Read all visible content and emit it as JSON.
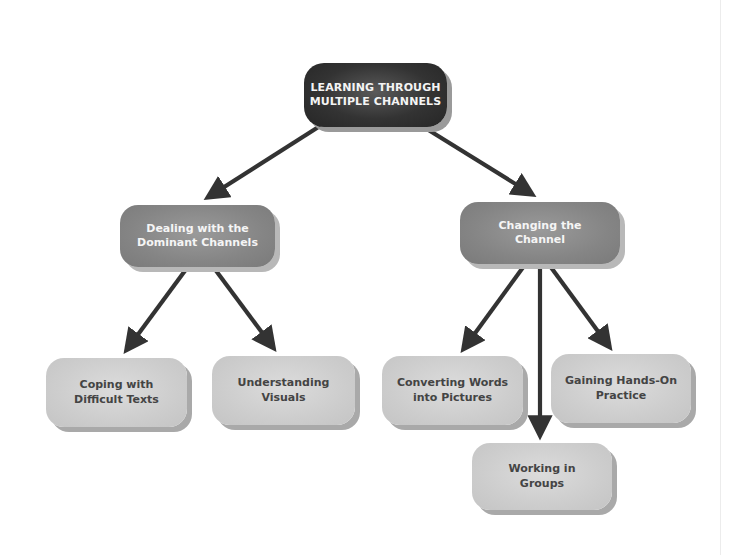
{
  "diagram": {
    "type": "concept-map",
    "root": {
      "line1": "LEARNING THROUGH",
      "line2": "MULTIPLE CHANNELS"
    },
    "branches": [
      {
        "line1": "Dealing with the",
        "line2": "Dominant Channels",
        "children": [
          {
            "line1": "Coping with",
            "line2": "Difficult Texts"
          },
          {
            "line1": "Understanding",
            "line2": "Visuals"
          }
        ]
      },
      {
        "line1": "Changing the",
        "line2": "Channel",
        "children": [
          {
            "line1": "Converting Words",
            "line2": "into Pictures"
          },
          {
            "line1": "Working in",
            "line2": "Groups"
          },
          {
            "line1": "Gaining Hands-On",
            "line2": "Practice"
          }
        ]
      }
    ],
    "colors": {
      "root_fill": "#333333",
      "root_text": "#f4f4f4",
      "mid_fill": "#858585",
      "mid_text": "#f5f5f5",
      "leaf_fill": "#cdcdcd",
      "leaf_text": "#444444",
      "arrow": "#333333"
    }
  }
}
